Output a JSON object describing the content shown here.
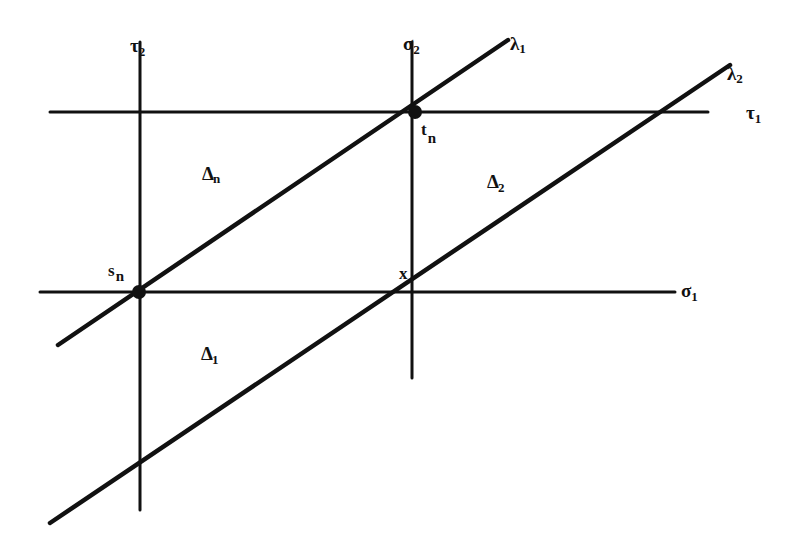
{
  "diagram": {
    "stroke_color": "#111111",
    "background": "#ffffff",
    "lines": [
      {
        "id": "tau2",
        "label": "τ",
        "sub": "2",
        "x1": 140,
        "y1": 42,
        "x2": 140,
        "y2": 510
      },
      {
        "id": "sigma2",
        "label": "σ",
        "sub": "2",
        "x1": 412,
        "y1": 42,
        "x2": 412,
        "y2": 378
      },
      {
        "id": "tau1",
        "label": "τ",
        "sub": "1",
        "x1": 50,
        "y1": 112,
        "x2": 708,
        "y2": 112
      },
      {
        "id": "sigma1",
        "label": "σ",
        "sub": "1",
        "x1": 40,
        "y1": 292,
        "x2": 675,
        "y2": 292
      },
      {
        "id": "lambda1",
        "label": "λ",
        "sub": "1",
        "x1": 58,
        "y1": 345,
        "x2": 508,
        "y2": 40
      },
      {
        "id": "lambda2",
        "label": "λ",
        "sub": "2",
        "x1": 50,
        "y1": 523,
        "x2": 730,
        "y2": 65
      }
    ],
    "labels": {
      "tau2": {
        "main": "τ",
        "sub": "2"
      },
      "sigma2": {
        "main": "σ",
        "sub": "2"
      },
      "lambda1": {
        "main": "λ",
        "sub": "1"
      },
      "lambda2": {
        "main": "λ",
        "sub": "2"
      },
      "tau1": {
        "main": "τ",
        "sub": "1"
      },
      "sigma1": {
        "main": "σ",
        "sub": "1"
      },
      "t_n": {
        "main": "t",
        "sub": "n"
      },
      "s_n": {
        "main": "s",
        "sub": "n"
      },
      "x": {
        "main": "x"
      },
      "delta_n": {
        "main": "Δ",
        "sub": "n"
      },
      "delta_2": {
        "main": "Δ",
        "sub": "2"
      },
      "delta_1": {
        "main": "Δ",
        "sub": "1"
      }
    },
    "points": [
      {
        "id": "s_n",
        "cx": 139,
        "cy": 292,
        "r": 7
      },
      {
        "id": "t_n",
        "cx": 415,
        "cy": 112,
        "r": 7
      }
    ]
  }
}
